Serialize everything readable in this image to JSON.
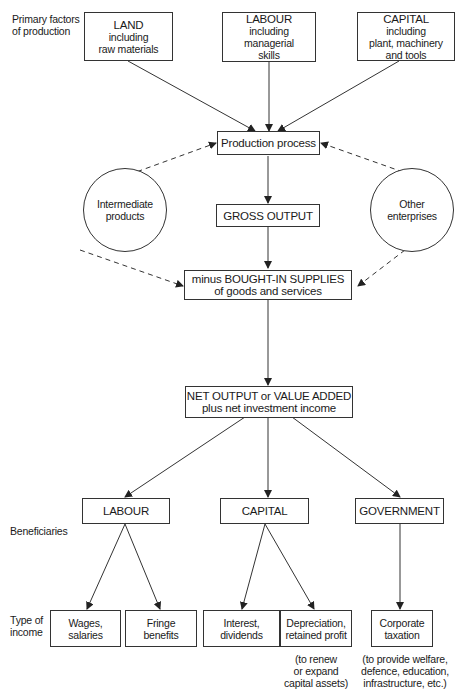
{
  "row_labels": {
    "primary": [
      "Primary factors",
      "of production"
    ],
    "beneficiaries": "Beneficiaries",
    "type_of_income": [
      "Type of",
      "income"
    ]
  },
  "factors": [
    {
      "title": "LAND",
      "lines": [
        "including",
        "raw materials"
      ]
    },
    {
      "title": "LABOUR",
      "lines": [
        "including",
        "managerial",
        "skills"
      ]
    },
    {
      "title": "CAPITAL",
      "lines": [
        "including",
        "plant, machinery",
        "and tools"
      ]
    }
  ],
  "process": "Production process",
  "gross_output": "GROSS OUTPUT",
  "bought_in": [
    "minus BOUGHT-IN SUPPLIES",
    "of goods and services"
  ],
  "net_output": [
    "NET OUTPUT or VALUE ADDED",
    "plus net investment income"
  ],
  "side_circles": {
    "left": [
      "Intermediate",
      "products"
    ],
    "right": [
      "Other",
      "enterprises"
    ]
  },
  "beneficiaries": [
    "LABOUR",
    "CAPITAL",
    "GOVERNMENT"
  ],
  "incomes": [
    {
      "lines": [
        "Wages,",
        "salaries"
      ]
    },
    {
      "lines": [
        "Fringe",
        "benefits"
      ]
    },
    {
      "lines": [
        "Interest,",
        "dividends"
      ]
    },
    {
      "lines": [
        "Depreciation,",
        "retained profit"
      ]
    },
    {
      "lines": [
        "Corporate",
        "taxation"
      ]
    }
  ],
  "notes": {
    "capital": [
      "(to renew",
      "or expand",
      "capital assets)"
    ],
    "government": [
      "(to provide welfare,",
      "defence, education,",
      "infrastructure, etc.)"
    ]
  },
  "colors": {
    "line": "#333333",
    "background": "#ffffff",
    "text": "#1a1a1a"
  }
}
